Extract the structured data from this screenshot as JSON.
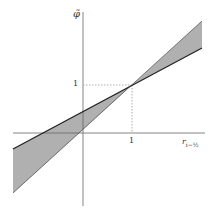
{
  "diagram": {
    "y_axis_label": "φ̃",
    "x_axis_label_main": "r",
    "x_axis_label_sub": "i−½",
    "y_tick_label": "1",
    "x_tick_label": "1",
    "colors": {
      "region_fill": "#b0b0b0",
      "bound_line": "#222222",
      "axis": "#666666",
      "guide": "#999999"
    },
    "lines": [
      {
        "name": "upper-bound-line",
        "points": [
          [
            13,
            149
          ],
          [
            132,
            85
          ],
          [
            202,
            48
          ]
        ]
      },
      {
        "name": "lower-bound-line",
        "points": [
          [
            13,
            193
          ],
          [
            132,
            85
          ],
          [
            202,
            21
          ]
        ]
      }
    ],
    "intersection_point": [
      1,
      1
    ]
  }
}
